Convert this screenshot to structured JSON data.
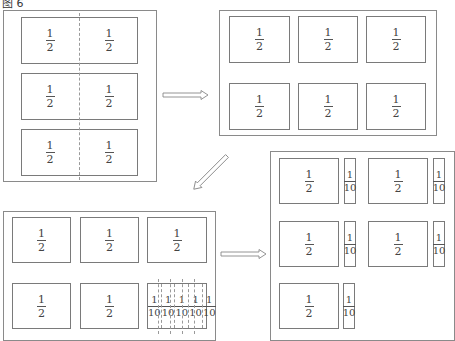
{
  "title": "图 6",
  "panels": {
    "panel1": {
      "description": "Three rectangles each split in half by a dashed vertical line",
      "halves": [
        {
          "num": "1",
          "den": "2"
        },
        {
          "num": "1",
          "den": "2"
        },
        {
          "num": "1",
          "den": "2"
        },
        {
          "num": "1",
          "den": "2"
        },
        {
          "num": "1",
          "den": "2"
        },
        {
          "num": "1",
          "den": "2"
        }
      ]
    },
    "panel2": {
      "description": "Six separated halves arranged 3x2",
      "halves": [
        {
          "num": "1",
          "den": "2"
        },
        {
          "num": "1",
          "den": "2"
        },
        {
          "num": "1",
          "den": "2"
        },
        {
          "num": "1",
          "den": "2"
        },
        {
          "num": "1",
          "den": "2"
        },
        {
          "num": "1",
          "den": "2"
        }
      ]
    },
    "panel3": {
      "description": "Five halves plus one half split into five tenths",
      "halves": [
        {
          "num": "1",
          "den": "2"
        },
        {
          "num": "1",
          "den": "2"
        },
        {
          "num": "1",
          "den": "2"
        },
        {
          "num": "1",
          "den": "2"
        },
        {
          "num": "1",
          "den": "2"
        }
      ],
      "tenths": [
        {
          "num": "1",
          "den": "10"
        },
        {
          "num": "1",
          "den": "10"
        },
        {
          "num": "1",
          "den": "10"
        },
        {
          "num": "1",
          "den": "10"
        },
        {
          "num": "1",
          "den": "10"
        }
      ]
    },
    "panel4": {
      "description": "Five groups each of one half plus one tenth",
      "groups": [
        {
          "half": {
            "num": "1",
            "den": "2"
          },
          "tenth": {
            "num": "1",
            "den": "10"
          }
        },
        {
          "half": {
            "num": "1",
            "den": "2"
          },
          "tenth": {
            "num": "1",
            "den": "10"
          }
        },
        {
          "half": {
            "num": "1",
            "den": "2"
          },
          "tenth": {
            "num": "1",
            "den": "10"
          }
        },
        {
          "half": {
            "num": "1",
            "den": "2"
          },
          "tenth": {
            "num": "1",
            "den": "10"
          }
        },
        {
          "half": {
            "num": "1",
            "den": "2"
          },
          "tenth": {
            "num": "1",
            "den": "10"
          }
        }
      ]
    }
  },
  "arrows": [
    {
      "from": "panel1",
      "to": "panel2",
      "direction": "right"
    },
    {
      "from": "panel2",
      "to": "panel3",
      "direction": "down-left"
    },
    {
      "from": "panel3",
      "to": "panel4",
      "direction": "right"
    }
  ],
  "colors": {
    "stroke": "#7a7a7a",
    "text": "#444444",
    "background": "#ffffff"
  }
}
